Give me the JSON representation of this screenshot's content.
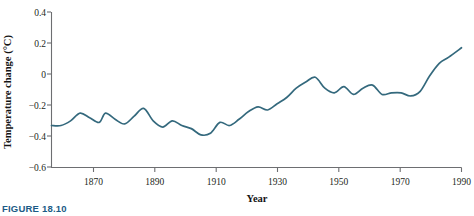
{
  "figure": {
    "caption": "FIGURE 18.10"
  },
  "chart_data": {
    "type": "line",
    "title": "",
    "xlabel": "Year",
    "ylabel": "Temperature change (°C)",
    "xlim": [
      1861,
      1990
    ],
    "ylim": [
      -0.6,
      0.4
    ],
    "xticks": [
      1870,
      1890,
      1910,
      1930,
      1950,
      1970,
      1990
    ],
    "xtick_labels": [
      "1870",
      "1890",
      "1910",
      "1930",
      "1950",
      "1970",
      "1990"
    ],
    "yticks": [
      -0.6,
      -0.4,
      -0.2,
      0,
      0.2,
      0.4
    ],
    "ytick_labels": [
      "−0.6",
      "−0.4",
      "−0.2",
      "0",
      "0.2",
      "0.4"
    ],
    "grid": false,
    "legend": null,
    "series": [
      {
        "name": "Global temperature change",
        "color": "#34697d",
        "line_width": 1.7,
        "x": [
          1861,
          1864,
          1867,
          1870,
          1873,
          1876,
          1878,
          1881,
          1884,
          1887,
          1890,
          1893,
          1896,
          1899,
          1902,
          1905,
          1908,
          1911,
          1914,
          1917,
          1920,
          1923,
          1926,
          1929,
          1932,
          1935,
          1938,
          1941,
          1944,
          1947,
          1950,
          1953,
          1956,
          1959,
          1962,
          1965,
          1968,
          1971,
          1974,
          1977,
          1980,
          1983,
          1986,
          1990
        ],
        "y": [
          -0.33,
          -0.33,
          -0.3,
          -0.25,
          -0.28,
          -0.31,
          -0.25,
          -0.29,
          -0.32,
          -0.27,
          -0.22,
          -0.3,
          -0.34,
          -0.3,
          -0.33,
          -0.35,
          -0.39,
          -0.38,
          -0.31,
          -0.33,
          -0.29,
          -0.24,
          -0.21,
          -0.23,
          -0.19,
          -0.15,
          -0.09,
          -0.05,
          -0.02,
          -0.09,
          -0.12,
          -0.08,
          -0.13,
          -0.09,
          -0.07,
          -0.13,
          -0.12,
          -0.12,
          -0.14,
          -0.11,
          -0.01,
          0.07,
          0.11,
          0.17
        ]
      }
    ]
  }
}
